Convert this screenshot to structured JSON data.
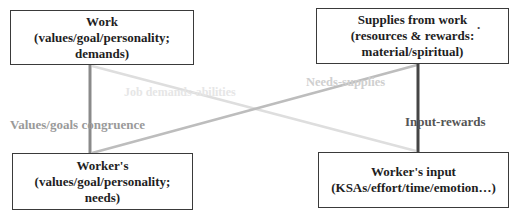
{
  "diagram": {
    "type": "person-environment fit diagram",
    "nodes": {
      "work": {
        "title": "Work",
        "line2": "(values/goal/personality;",
        "line3": "demands)"
      },
      "supplies": {
        "title": "Supplies from work",
        "trailing_mark": ".",
        "line2": "(resources & rewards:",
        "line3": "material/spiritual)"
      },
      "worker": {
        "title": "Worker's",
        "line2": "(values/goal/personality;",
        "line3": "needs)"
      },
      "input": {
        "title": "Worker's input",
        "line2": "(KSAs/effort/time/emotion…)"
      }
    },
    "edges": [
      {
        "id": "values-congruence",
        "from": "work",
        "to": "worker",
        "label": "Values/goals congruence",
        "color": "#8a8a8a"
      },
      {
        "id": "job-demands",
        "from": "work",
        "to": "input",
        "label": "Job demands-abilities",
        "color": "#dedede"
      },
      {
        "id": "needs-supplies",
        "from": "worker",
        "to": "supplies",
        "label": "Needs-supplies",
        "color": "#bdbdbd"
      },
      {
        "id": "input-rewards",
        "from": "supplies",
        "to": "input",
        "label": "Input-rewards",
        "color": "#454545"
      }
    ],
    "colors": {
      "box_border": "#3a3a3a",
      "text": "#1e1e1e",
      "background": "#ffffff"
    }
  }
}
